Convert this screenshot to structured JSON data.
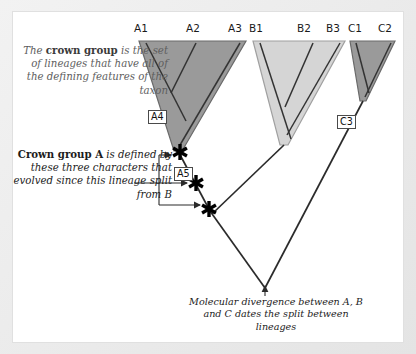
{
  "figure": {
    "background_color": "#e9e9e9",
    "panel_color": "#ffffff"
  },
  "colors": {
    "clade_a_fill": "#9a9a9a",
    "clade_b_fill": "#d5d5d5",
    "clade_c_fill": "#9a9a9a",
    "clade_stroke": "#5a5a5a",
    "branch_line": "#2b2b2b",
    "text_dark": "#1c1c1c",
    "text_gray": "#5e5e5e",
    "marker": "#000000"
  },
  "tip_labels": [
    {
      "id": "A1",
      "label": "A1",
      "x": 141,
      "y": 22
    },
    {
      "id": "A2",
      "label": "A2",
      "x": 193,
      "y": 22
    },
    {
      "id": "A3",
      "label": "A3",
      "x": 235,
      "y": 22
    },
    {
      "id": "B1",
      "label": "B1",
      "x": 256,
      "y": 22
    },
    {
      "id": "B2",
      "label": "B2",
      "x": 304,
      "y": 22
    },
    {
      "id": "B3",
      "label": "B3",
      "x": 333,
      "y": 22
    },
    {
      "id": "C1",
      "label": "C1",
      "x": 355,
      "y": 22
    },
    {
      "id": "C2",
      "label": "C2",
      "x": 385,
      "y": 22
    }
  ],
  "node_labels": [
    {
      "id": "A4",
      "label": "A4",
      "x": 148,
      "y": 110
    },
    {
      "id": "A5",
      "label": "A5",
      "x": 174,
      "y": 167
    },
    {
      "id": "C3",
      "label": "C3",
      "x": 337,
      "y": 115
    }
  ],
  "callouts": {
    "crown_group": {
      "lead": "The ",
      "bold": "crown group",
      "rest": " is the set of lineages that have all of the defining features of the taxon"
    },
    "crown_group_a": {
      "bold": "Crown group A",
      "rest": " is defined by these three characters that evolved since this lineage split from B"
    },
    "molecular": "Molecular divergence between A, B and C dates the split between lineages"
  },
  "markers": {
    "character_count": 3,
    "glyph": "asterisk",
    "description": "three derived characters on the stem lineage of crown group A"
  },
  "clades": [
    {
      "id": "A",
      "name": "clade-a-triangle",
      "tips": [
        "A1",
        "A2",
        "A3"
      ],
      "fill": "#9a9a9a"
    },
    {
      "id": "B",
      "name": "clade-b-triangle",
      "tips": [
        "B1",
        "B2",
        "B3"
      ],
      "fill": "#d5d5d5"
    },
    {
      "id": "C",
      "name": "clade-c-triangle",
      "tips": [
        "C1",
        "C2"
      ],
      "fill": "#9a9a9a"
    }
  ],
  "root": {
    "name": "molecular-divergence-node",
    "x": 265,
    "y": 288
  }
}
